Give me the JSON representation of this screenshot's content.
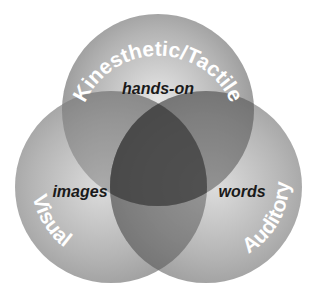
{
  "diagram": {
    "type": "venn",
    "circles": [
      {
        "id": "top",
        "label": "Kinesthetic/Tactile",
        "cx": 158,
        "cy": 110,
        "r": 96
      },
      {
        "id": "left",
        "label": "Visual",
        "cx": 111,
        "cy": 187,
        "r": 96
      },
      {
        "id": "right",
        "label": "Auditory",
        "cx": 206,
        "cy": 187,
        "r": 96
      }
    ],
    "overlaps": [
      {
        "between": [
          "top",
          "left",
          "right"
        ],
        "label": "hands-on"
      },
      {
        "between": [
          "left"
        ],
        "label": "images"
      },
      {
        "between": [
          "right"
        ],
        "label": "words"
      }
    ]
  },
  "labels": {
    "kinesthetic": "Kinesthetic/Tactile",
    "visual": "Visual",
    "auditory": "Auditory",
    "hands_on": "hands-on",
    "images": "images",
    "words": "words"
  },
  "colors": {
    "circle_fill": "#8a8a8a",
    "circle_highlight": "#d8d8d8",
    "background": "#ffffff",
    "label_text": "#ffffff",
    "overlap_text": "#1a1a1a"
  }
}
